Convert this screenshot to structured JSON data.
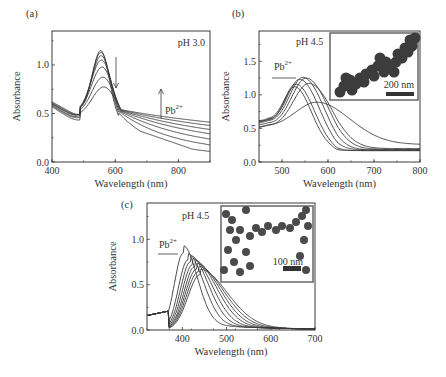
{
  "figure": {
    "panels": [
      {
        "id": "a",
        "label": "(a)",
        "annotation": "pH 3.0",
        "arrow_label": "Pb",
        "arrow_label_sup": "2+"
      },
      {
        "id": "b",
        "label": "(b)",
        "annotation": "pH 4.5",
        "arrow_label": "Pb",
        "arrow_label_sup": "2+",
        "inset_scale": "200 nm"
      },
      {
        "id": "c",
        "label": "(c)",
        "annotation": "pH 4.5",
        "arrow_label": "Pb",
        "arrow_label_sup": "2+",
        "inset_scale": "100 nm"
      }
    ]
  },
  "chart_data": [
    {
      "type": "line",
      "panel": "(a)",
      "title": "pH 3.0",
      "xlabel": "Wavelength (nm)",
      "ylabel": "Absorbance",
      "xlim": [
        400,
        900
      ],
      "ylim": [
        0.0,
        1.35
      ],
      "xticks": [
        400,
        600,
        800
      ],
      "yticks": [
        0.0,
        0.5,
        1.0
      ],
      "grid": false,
      "annotations": [
        "pH 3.0",
        "Pb2+ (arrow up, long wavelength)",
        "arrow down at peak"
      ],
      "series": [
        {
          "name": "0",
          "peak_x": 555,
          "peak_y": 1.22,
          "base400": 0.62,
          "dip_y": 0.55,
          "tail900": 0.07
        },
        {
          "name": "1",
          "peak_x": 556,
          "peak_y": 1.2,
          "base400": 0.61,
          "dip_y": 0.54,
          "tail900": 0.09
        },
        {
          "name": "2",
          "peak_x": 557,
          "peak_y": 1.16,
          "base400": 0.6,
          "dip_y": 0.53,
          "tail900": 0.11
        },
        {
          "name": "3",
          "peak_x": 558,
          "peak_y": 1.11,
          "base400": 0.6,
          "dip_y": 0.52,
          "tail900": 0.14
        },
        {
          "name": "4",
          "peak_x": 560,
          "peak_y": 1.03,
          "base400": 0.59,
          "dip_y": 0.5,
          "tail900": 0.17
        },
        {
          "name": "5",
          "peak_x": 563,
          "peak_y": 0.92,
          "base400": 0.58,
          "dip_y": 0.49,
          "tail900": 0.21
        },
        {
          "name": "6",
          "peak_x": 566,
          "peak_y": 0.81,
          "base400": 0.57,
          "dip_y": 0.47,
          "tail900": 0.25
        }
      ]
    },
    {
      "type": "line",
      "panel": "(b)",
      "title": "pH 4.5",
      "xlabel": "Wavelength (nm)",
      "ylabel": "Absorbance",
      "xlim": [
        450,
        800
      ],
      "ylim": [
        0.0,
        1.95
      ],
      "xticks": [
        500,
        600,
        700,
        800
      ],
      "yticks": [
        0.0,
        0.5,
        1.0,
        1.5
      ],
      "grid": false,
      "annotations": [
        "pH 4.5",
        "Pb2+ (arrow right)",
        "inset TEM: 200 nm scale"
      ],
      "series": [
        {
          "name": "0",
          "peak_x": 527,
          "peak_y": 1.12,
          "base450": 0.6,
          "tail800": 0.17
        },
        {
          "name": "1",
          "peak_x": 530,
          "peak_y": 1.16,
          "base450": 0.61,
          "tail800": 0.17
        },
        {
          "name": "2",
          "peak_x": 538,
          "peak_y": 1.23,
          "base450": 0.6,
          "tail800": 0.18
        },
        {
          "name": "3",
          "peak_x": 545,
          "peak_y": 1.26,
          "base450": 0.58,
          "tail800": 0.18
        },
        {
          "name": "4",
          "peak_x": 552,
          "peak_y": 1.25,
          "base450": 0.55,
          "tail800": 0.19
        },
        {
          "name": "5",
          "peak_x": 558,
          "peak_y": 1.17,
          "base450": 0.52,
          "tail800": 0.2
        },
        {
          "name": "6",
          "peak_x": 575,
          "peak_y": 0.89,
          "base450": 0.49,
          "tail800": 0.26
        }
      ]
    },
    {
      "type": "line",
      "panel": "(c)",
      "title": "pH 4.5",
      "xlabel": "Wavelength (nm)",
      "ylabel": "Absorbance",
      "xlim": [
        320,
        700
      ],
      "ylim": [
        0.0,
        1.4
      ],
      "xticks": [
        400,
        500,
        600,
        700
      ],
      "yticks": [
        0.0,
        0.5,
        1.0
      ],
      "grid": false,
      "annotations": [
        "pH 4.5",
        "Pb2+ (arrow right)",
        "inset TEM: 100 nm scale"
      ],
      "series": [
        {
          "name": "0",
          "peak_x": 402,
          "peak_y": 0.85
        },
        {
          "name": "1",
          "peak_x": 412,
          "peak_y": 0.77
        },
        {
          "name": "2",
          "peak_x": 418,
          "peak_y": 0.75
        },
        {
          "name": "3",
          "peak_x": 423,
          "peak_y": 0.72
        },
        {
          "name": "4",
          "peak_x": 428,
          "peak_y": 0.7
        },
        {
          "name": "5",
          "peak_x": 432,
          "peak_y": 0.67
        },
        {
          "name": "6",
          "peak_x": 436,
          "peak_y": 0.64
        },
        {
          "name": "7",
          "peak_x": 440,
          "peak_y": 0.61
        }
      ]
    }
  ]
}
